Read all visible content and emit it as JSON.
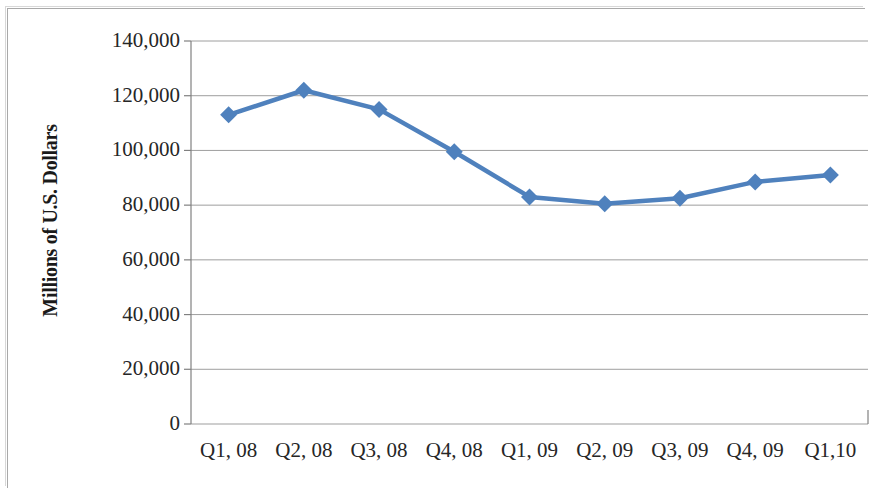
{
  "chart_data": {
    "type": "line",
    "title": "",
    "subtitle": "",
    "xlabel": "",
    "ylabel": "Millions of U.S. Dollars",
    "categories": [
      "Q1, 08",
      "Q2, 08",
      "Q3, 08",
      "Q4, 08",
      "Q1, 09",
      "Q2, 09",
      "Q3, 09",
      "Q4, 09",
      "Q1,10"
    ],
    "values": [
      113000,
      122000,
      115000,
      99500,
      83000,
      80500,
      82500,
      88500,
      91000
    ],
    "ylim": [
      0,
      140000
    ],
    "y_ticks": [
      0,
      20000,
      40000,
      60000,
      80000,
      100000,
      120000,
      140000
    ],
    "y_tick_labels": [
      "0",
      "20,000",
      "40,000",
      "60,000",
      "80,000",
      "100,000",
      "120,000",
      "140,000"
    ],
    "grid": "horizontal",
    "legend": "none",
    "series": [
      {
        "name": "",
        "color": "#4F81BD",
        "marker": "diamond",
        "values": [
          113000,
          122000,
          115000,
          99500,
          83000,
          80500,
          82500,
          88500,
          91000
        ]
      }
    ],
    "colors": {
      "line": "#4F81BD",
      "marker": "#4F81BD",
      "gridline": "#9e9e9e",
      "axis": "#808080",
      "text": "#262626",
      "frame": "#a9a9a9",
      "background": "#ffffff"
    }
  }
}
